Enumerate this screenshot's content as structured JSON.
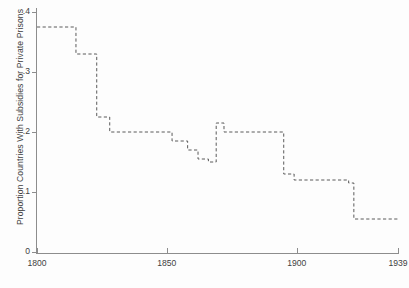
{
  "chart_data": {
    "type": "line",
    "subtype": "step",
    "title": "",
    "xlabel": "",
    "ylabel": "Proportion Countries With Subsidies for Private Prisons",
    "xlim": [
      1800,
      1939
    ],
    "ylim": [
      0,
      0.4
    ],
    "grid": false,
    "legend": null,
    "line_style": "dashed",
    "line_color": "#5a5a5a",
    "xticks": [
      1800,
      1850,
      1900,
      1939
    ],
    "xticklabels": [
      "1800",
      "1850",
      "1900",
      "1939"
    ],
    "yticks": [
      0,
      0.1,
      0.2,
      0.3,
      0.4
    ],
    "yticklabels": [
      "0",
      ".1",
      ".2",
      ".3",
      ".4"
    ],
    "x": [
      1800,
      1815,
      1823,
      1828,
      1852,
      1858,
      1862,
      1866,
      1869,
      1872,
      1895,
      1899,
      1920,
      1922,
      1939
    ],
    "values": [
      0.375,
      0.33,
      0.225,
      0.2,
      0.185,
      0.17,
      0.155,
      0.15,
      0.215,
      0.2,
      0.13,
      0.12,
      0.115,
      0.055,
      0.055
    ],
    "series": [
      {
        "name": "Proportion Countries With Subsidies for Private Prisons",
        "points": [
          {
            "year": 1800,
            "value": 0.375
          },
          {
            "year": 1815,
            "value": 0.33
          },
          {
            "year": 1823,
            "value": 0.225
          },
          {
            "year": 1828,
            "value": 0.2
          },
          {
            "year": 1852,
            "value": 0.185
          },
          {
            "year": 1858,
            "value": 0.17
          },
          {
            "year": 1862,
            "value": 0.155
          },
          {
            "year": 1866,
            "value": 0.15
          },
          {
            "year": 1869,
            "value": 0.215
          },
          {
            "year": 1872,
            "value": 0.2
          },
          {
            "year": 1895,
            "value": 0.13
          },
          {
            "year": 1899,
            "value": 0.12
          },
          {
            "year": 1920,
            "value": 0.115
          },
          {
            "year": 1922,
            "value": 0.055
          },
          {
            "year": 1939,
            "value": 0.055
          }
        ]
      }
    ]
  },
  "axes": {
    "y_title": "Proportion Countries With Subsidies for Private Prisons",
    "yticklabels": [
      "0",
      ".1",
      ".2",
      ".3",
      ".4"
    ],
    "xticklabels": [
      "1800",
      "1850",
      "1900",
      "1939"
    ]
  }
}
